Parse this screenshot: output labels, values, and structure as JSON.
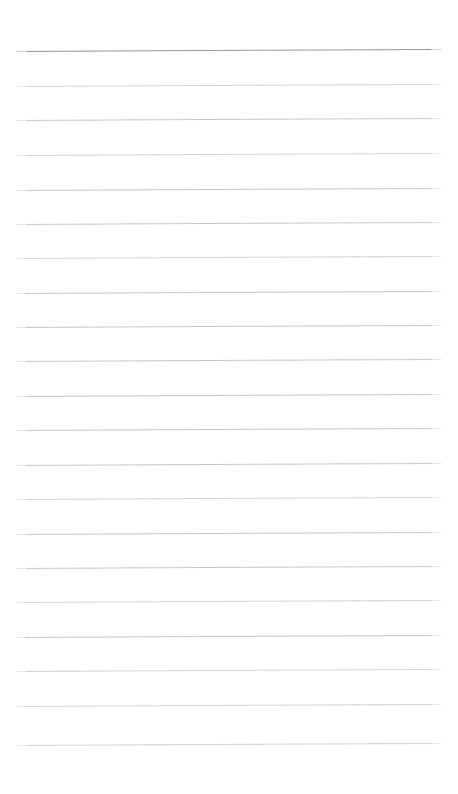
{
  "document": {
    "kind": "lined-paper",
    "title": "Blank ruled notebook page",
    "page_width": 458,
    "page_height": 794,
    "background_color": "#ffffff",
    "orientation": "portrait",
    "has_text_content": false,
    "body_text": ""
  },
  "ruling": {
    "line_count": 21,
    "line_spacing_px": 34.5,
    "line_left_x": 16,
    "line_right_x": 441,
    "line_length_px": 425,
    "top_margin_px": 51,
    "bottom_margin_px": 49,
    "left_margin_px": 16,
    "right_margin_px": 17,
    "skew_degrees": -0.28,
    "header_rule_color": "#93959a",
    "body_rule_color": "#c3c4c6",
    "faint_rule_color": "#cfd0d2",
    "lines": [
      {
        "index": 1,
        "y": 51,
        "emphasis": "header",
        "color": "#93959a"
      },
      {
        "index": 2,
        "y": 86,
        "emphasis": "normal",
        "color": "#cfd0d2"
      },
      {
        "index": 3,
        "y": 120,
        "emphasis": "normal",
        "color": "#c3c4c6"
      },
      {
        "index": 4,
        "y": 155,
        "emphasis": "normal",
        "color": "#cfd0d2"
      },
      {
        "index": 5,
        "y": 190,
        "emphasis": "normal",
        "color": "#c3c4c6"
      },
      {
        "index": 6,
        "y": 224,
        "emphasis": "normal",
        "color": "#c3c4c6"
      },
      {
        "index": 7,
        "y": 258,
        "emphasis": "normal",
        "color": "#cfd0d2"
      },
      {
        "index": 8,
        "y": 293,
        "emphasis": "normal",
        "color": "#c3c4c6"
      },
      {
        "index": 9,
        "y": 327,
        "emphasis": "normal",
        "color": "#c3c4c6"
      },
      {
        "index": 10,
        "y": 361,
        "emphasis": "normal",
        "color": "#c3c4c6"
      },
      {
        "index": 11,
        "y": 396,
        "emphasis": "normal",
        "color": "#c3c4c6"
      },
      {
        "index": 12,
        "y": 430,
        "emphasis": "normal",
        "color": "#c3c4c6"
      },
      {
        "index": 13,
        "y": 465,
        "emphasis": "normal",
        "color": "#c3c4c6"
      },
      {
        "index": 14,
        "y": 499,
        "emphasis": "normal",
        "color": "#cfd0d2"
      },
      {
        "index": 15,
        "y": 534,
        "emphasis": "normal",
        "color": "#c3c4c6"
      },
      {
        "index": 16,
        "y": 568,
        "emphasis": "normal",
        "color": "#c3c4c6"
      },
      {
        "index": 17,
        "y": 602,
        "emphasis": "normal",
        "color": "#cfd0d2"
      },
      {
        "index": 18,
        "y": 637,
        "emphasis": "normal",
        "color": "#c3c4c6"
      },
      {
        "index": 19,
        "y": 671,
        "emphasis": "normal",
        "color": "#cfd0d2"
      },
      {
        "index": 20,
        "y": 706,
        "emphasis": "normal",
        "color": "#cfd0d2"
      },
      {
        "index": 21,
        "y": 745,
        "emphasis": "normal",
        "color": "#cfd0d2"
      }
    ]
  }
}
